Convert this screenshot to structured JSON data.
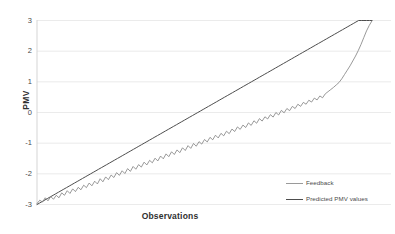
{
  "chart_data": {
    "type": "line",
    "title": "",
    "xlabel": "Observations",
    "ylabel": "PMV",
    "ylim": [
      -3,
      3
    ],
    "xlim": [
      0,
      120
    ],
    "yticks": [
      3,
      2,
      1,
      0,
      -1,
      -2,
      -3
    ],
    "ytick_labels": [
      "3",
      "2",
      "1",
      "0",
      "-1",
      "-2",
      "-3"
    ],
    "xticks": [],
    "xtick_labels": [],
    "grid": "horizontal",
    "legend_position": "inside-lower-right",
    "series": [
      {
        "name": "Feedback",
        "color": "#7f7f7f",
        "width": 0.8,
        "values": [
          -2.97,
          -2.86,
          -2.92,
          -2.78,
          -2.88,
          -2.74,
          -2.83,
          -2.7,
          -2.78,
          -2.62,
          -2.7,
          -2.55,
          -2.64,
          -2.49,
          -2.58,
          -2.44,
          -2.52,
          -2.37,
          -2.45,
          -2.3,
          -2.39,
          -2.24,
          -2.33,
          -2.16,
          -2.26,
          -2.1,
          -2.19,
          -2.04,
          -2.12,
          -1.96,
          -2.05,
          -1.9,
          -1.99,
          -1.83,
          -1.92,
          -1.76,
          -1.85,
          -1.7,
          -1.78,
          -1.62,
          -1.71,
          -1.56,
          -1.64,
          -1.49,
          -1.58,
          -1.42,
          -1.51,
          -1.35,
          -1.44,
          -1.28,
          -1.37,
          -1.22,
          -1.31,
          -1.15,
          -1.24,
          -1.08,
          -1.17,
          -1.01,
          -1.1,
          -0.95,
          -1.03,
          -0.88,
          -0.96,
          -0.81,
          -0.89,
          -0.74,
          -0.83,
          -0.68,
          -0.76,
          -0.61,
          -0.69,
          -0.54,
          -0.62,
          -0.47,
          -0.55,
          -0.41,
          -0.49,
          -0.34,
          -0.42,
          -0.27,
          -0.35,
          -0.2,
          -0.28,
          -0.14,
          -0.21,
          -0.07,
          -0.15,
          0.0,
          -0.08,
          0.07,
          -0.01,
          0.13,
          0.06,
          0.2,
          0.13,
          0.27,
          0.2,
          0.33,
          0.27,
          0.4,
          0.34,
          0.47,
          0.41,
          0.54,
          0.48,
          0.61,
          0.68,
          0.75,
          0.82,
          0.9,
          0.98,
          1.1,
          1.24,
          1.38,
          1.52,
          1.68,
          1.84,
          2.02,
          2.22,
          2.44,
          2.66,
          2.84,
          2.99
        ]
      },
      {
        "name": "Predicted PMV values",
        "color": "#4d4d4d",
        "width": 1.0,
        "values": [
          -3.0,
          -2.95,
          -2.9,
          -2.85,
          -2.8,
          -2.75,
          -2.7,
          -2.65,
          -2.6,
          -2.55,
          -2.5,
          -2.45,
          -2.4,
          -2.35,
          -2.3,
          -2.25,
          -2.2,
          -2.15,
          -2.1,
          -2.05,
          -2.0,
          -1.95,
          -1.9,
          -1.85,
          -1.8,
          -1.75,
          -1.7,
          -1.65,
          -1.6,
          -1.55,
          -1.5,
          -1.45,
          -1.4,
          -1.35,
          -1.3,
          -1.25,
          -1.2,
          -1.15,
          -1.1,
          -1.05,
          -1.0,
          -0.95,
          -0.9,
          -0.85,
          -0.8,
          -0.75,
          -0.7,
          -0.65,
          -0.6,
          -0.55,
          -0.5,
          -0.45,
          -0.4,
          -0.35,
          -0.3,
          -0.25,
          -0.2,
          -0.15,
          -0.1,
          -0.05,
          0.0,
          0.05,
          0.1,
          0.15,
          0.2,
          0.25,
          0.3,
          0.35,
          0.4,
          0.45,
          0.5,
          0.55,
          0.6,
          0.65,
          0.7,
          0.75,
          0.8,
          0.85,
          0.9,
          0.95,
          1.0,
          1.05,
          1.1,
          1.15,
          1.2,
          1.25,
          1.3,
          1.35,
          1.4,
          1.45,
          1.5,
          1.55,
          1.6,
          1.65,
          1.7,
          1.75,
          1.8,
          1.85,
          1.9,
          1.95,
          2.0,
          2.05,
          2.1,
          2.15,
          2.2,
          2.25,
          2.3,
          2.35,
          2.4,
          2.45,
          2.5,
          2.55,
          2.6,
          2.65,
          2.7,
          2.75,
          2.8,
          2.85,
          2.9,
          2.95,
          3.0,
          3.0,
          3.0,
          3.0,
          3.0,
          3.0
        ]
      }
    ]
  },
  "axes": {
    "y_title": "PMV",
    "x_title": "Observations",
    "tick_labels": [
      "3",
      "2",
      "1",
      "0",
      "-1",
      "-2",
      "-3"
    ]
  },
  "legend": {
    "items": [
      {
        "label": "Feedback",
        "color": "#9a9a9a"
      },
      {
        "label": "Predicted PMV values",
        "color": "#4d4d4d"
      }
    ]
  },
  "colors": {
    "gridline": "#e6e6e6",
    "axis_line": "#d0d0d0",
    "text": "#4a4a4a",
    "background": "#ffffff"
  }
}
